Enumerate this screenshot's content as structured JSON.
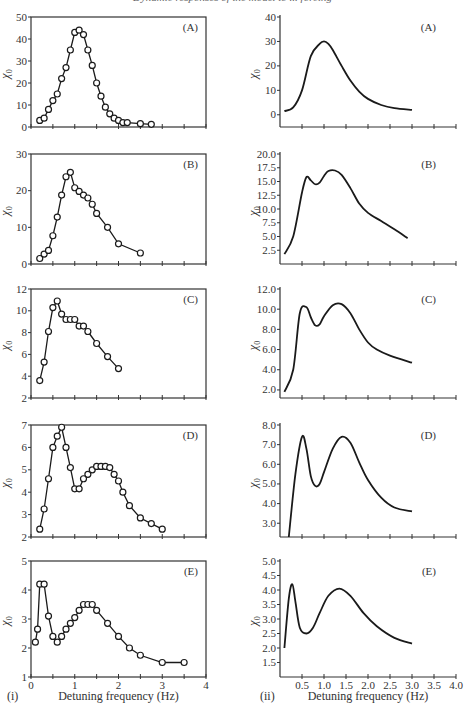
{
  "header": {
    "cropped_caption": "Dynamic responses of the model to ... forcing"
  },
  "columns": [
    {
      "label": "(i)",
      "xlabel": "Detuning frequency (Hz)"
    },
    {
      "label": "(ii)",
      "xlabel": "Detuning frequency (Hz)"
    }
  ],
  "colors": {
    "line": "#1a1a1a",
    "axis": "#333333",
    "text": "#333333"
  },
  "chart_data": [
    {
      "id": "i-A",
      "panel": "(A)",
      "type": "line",
      "markers": "open-circle",
      "title": "",
      "xlabel": "",
      "ylabel": "χ0",
      "xlim": [
        0,
        4
      ],
      "ylim": [
        0,
        50
      ],
      "yticks": [
        0,
        10,
        20,
        30,
        40,
        50
      ],
      "ytick_labels": [
        "0",
        "10",
        "20",
        "30",
        "40",
        "50"
      ],
      "xticks": [
        0,
        0.5,
        1,
        1.5,
        2,
        2.5,
        3,
        3.5,
        4
      ],
      "xtick_labels": [],
      "x": [
        0.2,
        0.3,
        0.4,
        0.5,
        0.6,
        0.7,
        0.8,
        0.9,
        1.0,
        1.1,
        1.2,
        1.3,
        1.4,
        1.5,
        1.6,
        1.7,
        1.8,
        1.9,
        2.0,
        2.1,
        2.2,
        2.5,
        2.75
      ],
      "y": [
        3,
        4,
        8,
        12,
        15,
        22,
        27,
        35,
        43,
        44,
        42,
        35,
        28,
        20,
        14,
        9,
        6,
        4,
        3,
        2,
        2,
        1.5,
        1.2
      ]
    },
    {
      "id": "i-B",
      "panel": "(B)",
      "type": "line",
      "markers": "open-circle",
      "title": "",
      "xlabel": "",
      "ylabel": "χ0",
      "xlim": [
        0,
        4
      ],
      "ylim": [
        0,
        30
      ],
      "yticks": [
        0,
        10,
        20,
        30
      ],
      "ytick_labels": [
        "0",
        "10",
        "20",
        "30"
      ],
      "xticks": [
        0,
        0.5,
        1,
        1.5,
        2,
        2.5,
        3,
        3.5,
        4
      ],
      "xtick_labels": [],
      "x": [
        0.2,
        0.3,
        0.4,
        0.5,
        0.6,
        0.7,
        0.8,
        0.9,
        1.0,
        1.1,
        1.2,
        1.3,
        1.4,
        1.5,
        1.75,
        2.0,
        2.5
      ],
      "y": [
        1.5,
        2.7,
        3.7,
        7.7,
        12.8,
        18.8,
        23.8,
        25,
        20.8,
        19.8,
        18.8,
        18,
        16.3,
        13.8,
        10,
        5.5,
        3
      ]
    },
    {
      "id": "i-C",
      "panel": "(C)",
      "type": "line",
      "markers": "open-circle",
      "title": "",
      "xlabel": "",
      "ylabel": "χ0",
      "xlim": [
        0,
        4
      ],
      "ylim": [
        2,
        12
      ],
      "yticks": [
        2,
        4,
        6,
        8,
        10,
        12
      ],
      "ytick_labels": [
        "2",
        "4",
        "6",
        "8",
        "10",
        "12"
      ],
      "xticks": [
        0,
        0.5,
        1,
        1.5,
        2,
        2.5,
        3,
        3.5,
        4
      ],
      "xtick_labels": [],
      "x": [
        0.2,
        0.3,
        0.4,
        0.5,
        0.6,
        0.7,
        0.8,
        0.9,
        1.0,
        1.1,
        1.2,
        1.3,
        1.5,
        1.75,
        2.0
      ],
      "y": [
        3.6,
        5.3,
        8.1,
        10.3,
        10.9,
        9.7,
        9.2,
        9.2,
        9.2,
        8.6,
        8.6,
        8.1,
        7,
        5.8,
        4.7
      ]
    },
    {
      "id": "i-D",
      "panel": "(D)",
      "type": "line",
      "markers": "open-circle",
      "title": "",
      "xlabel": "",
      "ylabel": "χ0",
      "xlim": [
        0,
        4
      ],
      "ylim": [
        2,
        7
      ],
      "yticks": [
        2,
        3,
        4,
        5,
        6,
        7
      ],
      "ytick_labels": [
        "2",
        "3",
        "4",
        "5",
        "6",
        "7"
      ],
      "xticks": [
        0,
        0.5,
        1,
        1.5,
        2,
        2.5,
        3,
        3.5,
        4
      ],
      "xtick_labels": [],
      "x": [
        0.2,
        0.3,
        0.4,
        0.5,
        0.6,
        0.7,
        0.8,
        0.9,
        1.0,
        1.1,
        1.2,
        1.3,
        1.4,
        1.5,
        1.6,
        1.7,
        1.8,
        1.9,
        2.0,
        2.1,
        2.25,
        2.5,
        2.75,
        3.0
      ],
      "y": [
        2.35,
        3.25,
        4.6,
        6,
        6.5,
        6.9,
        6,
        5.1,
        4.15,
        4.15,
        4.6,
        4.8,
        5,
        5.15,
        5.15,
        5.15,
        5.1,
        4.8,
        4.5,
        4,
        3.4,
        2.85,
        2.6,
        2.35
      ]
    },
    {
      "id": "i-E",
      "panel": "(E)",
      "type": "line",
      "markers": "open-circle",
      "title": "",
      "xlabel": "Detuning frequency (Hz)",
      "ylabel": "χ0",
      "xlim": [
        0,
        4
      ],
      "ylim": [
        1,
        5
      ],
      "yticks": [
        1,
        2,
        3,
        4,
        5
      ],
      "ytick_labels": [
        "1",
        "2",
        "3",
        "4",
        "5"
      ],
      "xticks": [
        0,
        0.5,
        1,
        1.5,
        2,
        2.5,
        3,
        3.5,
        4
      ],
      "xtick_labels": [
        "0",
        "",
        "1",
        "",
        "2",
        "",
        "3",
        "",
        "4"
      ],
      "x": [
        0.1,
        0.15,
        0.2,
        0.3,
        0.4,
        0.5,
        0.6,
        0.7,
        0.8,
        0.9,
        1.0,
        1.1,
        1.2,
        1.3,
        1.4,
        1.5,
        1.75,
        2.0,
        2.25,
        2.5,
        3.0,
        3.5
      ],
      "y": [
        2.2,
        2.65,
        4.2,
        4.2,
        3.1,
        2.4,
        2.2,
        2.4,
        2.65,
        2.85,
        3.05,
        3.3,
        3.5,
        3.5,
        3.5,
        3.3,
        2.85,
        2.4,
        2,
        1.75,
        1.5,
        1.5
      ]
    },
    {
      "id": "ii-A",
      "panel": "(A)",
      "type": "line",
      "markers": "none",
      "title": "",
      "xlabel": "",
      "ylabel": "χ0",
      "xlim": [
        0,
        4
      ],
      "ylim": [
        -5,
        40
      ],
      "yticks": [
        0,
        10,
        20,
        30,
        40
      ],
      "ytick_labels": [
        "0",
        "10",
        "20",
        "30",
        "40"
      ],
      "xticks": [
        0.5,
        1,
        1.5,
        2,
        2.5,
        3,
        3.5,
        4
      ],
      "xtick_labels": [],
      "x": [
        0.1,
        0.3,
        0.5,
        0.7,
        0.9,
        1.0,
        1.1,
        1.2,
        1.4,
        1.6,
        1.8,
        2.0,
        2.3,
        2.6,
        3.0
      ],
      "y": [
        1.5,
        3,
        10,
        24,
        29,
        30,
        29,
        26.5,
        20,
        14,
        9.5,
        6.5,
        4,
        2.7,
        2
      ]
    },
    {
      "id": "ii-B",
      "panel": "(B)",
      "type": "line",
      "markers": "none",
      "title": "",
      "xlabel": "",
      "ylabel": "χ0",
      "xlim": [
        0,
        4
      ],
      "ylim": [
        0,
        20
      ],
      "yticks": [
        2.5,
        5,
        7.5,
        10,
        12.5,
        15,
        17.5,
        20
      ],
      "ytick_labels": [
        "2.5",
        "5.0",
        "7.5",
        "10.0",
        "12.5",
        "15.0",
        "17.5",
        "20.0"
      ],
      "xticks": [
        0.5,
        1,
        1.5,
        2,
        2.5,
        3,
        3.5,
        4
      ],
      "xtick_labels": [],
      "x": [
        0.1,
        0.3,
        0.5,
        0.6,
        0.7,
        0.8,
        0.9,
        1.0,
        1.1,
        1.25,
        1.4,
        1.6,
        1.8,
        2.0,
        2.3,
        2.6,
        2.9
      ],
      "y": [
        1.8,
        5,
        13,
        15.8,
        15.2,
        14.5,
        14.8,
        16,
        16.9,
        17,
        16.2,
        13.8,
        11,
        9.3,
        7.8,
        6.3,
        4.7
      ]
    },
    {
      "id": "ii-C",
      "panel": "(C)",
      "type": "line",
      "markers": "none",
      "title": "",
      "xlabel": "",
      "ylabel": "χ0",
      "xlim": [
        0,
        4
      ],
      "ylim": [
        1.2,
        12
      ],
      "yticks": [
        2,
        4,
        6,
        8,
        10,
        12
      ],
      "ytick_labels": [
        "2.0",
        "4.0",
        "6.0",
        "8.0",
        "10.0",
        "12.0"
      ],
      "xticks": [
        0.5,
        1,
        1.5,
        2,
        2.5,
        3,
        3.5,
        4
      ],
      "xtick_labels": [],
      "x": [
        0.1,
        0.3,
        0.45,
        0.6,
        0.7,
        0.8,
        0.9,
        1.0,
        1.2,
        1.4,
        1.6,
        1.8,
        2.0,
        2.2,
        2.5,
        3.0
      ],
      "y": [
        1.8,
        4,
        9.6,
        10.2,
        9.2,
        8.4,
        8.5,
        9.3,
        10.4,
        10.5,
        9.6,
        8,
        6.7,
        6,
        5.4,
        4.7
      ]
    },
    {
      "id": "ii-D",
      "panel": "(D)",
      "type": "line",
      "markers": "none",
      "title": "",
      "xlabel": "",
      "ylabel": "χ0",
      "xlim": [
        0,
        4
      ],
      "ylim": [
        2.3,
        8
      ],
      "yticks": [
        3,
        4,
        5,
        6,
        7,
        8
      ],
      "ytick_labels": [
        "3.0",
        "4.0",
        "5.0",
        "6.0",
        "7.0",
        "8.0"
      ],
      "xticks": [
        0.5,
        1,
        1.5,
        2,
        2.5,
        3,
        3.5,
        4
      ],
      "xtick_labels": [],
      "x": [
        0.2,
        0.35,
        0.5,
        0.6,
        0.7,
        0.8,
        0.9,
        1.0,
        1.2,
        1.4,
        1.6,
        1.8,
        2.0,
        2.3,
        2.6,
        3.0
      ],
      "y": [
        2.3,
        5.5,
        7.4,
        6.8,
        5.4,
        4.9,
        5,
        5.6,
        6.8,
        7.4,
        7.1,
        6.1,
        5.2,
        4.3,
        3.8,
        3.6
      ]
    },
    {
      "id": "ii-E",
      "panel": "(E)",
      "type": "line",
      "markers": "none",
      "title": "",
      "xlabel": "Detuning frequency (Hz)",
      "ylabel": "χ0",
      "xlim": [
        0,
        4
      ],
      "ylim": [
        1.0,
        5
      ],
      "yticks": [
        1.5,
        2,
        2.5,
        3,
        3.5,
        4,
        4.5,
        5
      ],
      "ytick_labels": [
        "1.5",
        "2.0",
        "2.5",
        "3.0",
        "3.5",
        "4.0",
        "4.5",
        "5.0"
      ],
      "xticks": [
        0.5,
        1,
        1.5,
        2,
        2.5,
        3,
        3.5,
        4
      ],
      "xtick_labels": [
        "0.5",
        "1.0",
        "1.5",
        "2.0",
        "2.5",
        "3.0",
        "3.5",
        "4.0"
      ],
      "x": [
        0.1,
        0.2,
        0.28,
        0.35,
        0.45,
        0.6,
        0.75,
        0.9,
        1.1,
        1.35,
        1.6,
        1.9,
        2.2,
        2.6,
        3.0
      ],
      "y": [
        2,
        3.7,
        4.2,
        3.6,
        2.7,
        2.5,
        2.7,
        3.2,
        3.8,
        4.05,
        3.8,
        3.2,
        2.75,
        2.35,
        2.15
      ]
    }
  ]
}
